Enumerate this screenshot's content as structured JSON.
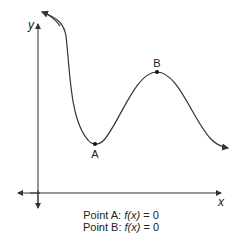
{
  "graph": {
    "x_axis_label": "x",
    "y_axis_label": "y",
    "points": [
      {
        "name": "A",
        "label": "A",
        "type": "local minimum"
      },
      {
        "name": "B",
        "label": "B",
        "type": "local maximum"
      }
    ]
  },
  "captions": [
    {
      "prefix": "Point A: ",
      "fx": "f(x)",
      "suffix": " = 0"
    },
    {
      "prefix": "Point B: ",
      "fx": "f(x)",
      "suffix": " = 0"
    }
  ],
  "colors": {
    "line": "#333333",
    "background": "#ffffff"
  }
}
